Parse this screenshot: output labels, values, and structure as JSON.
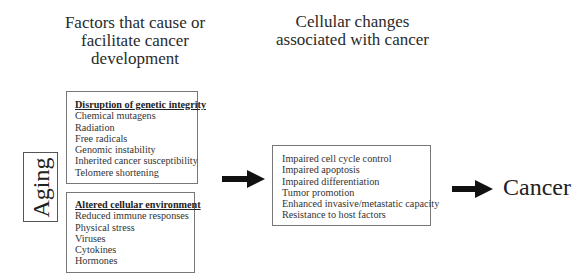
{
  "headings": {
    "left": [
      "Factors that cause or",
      "facilitate cancer",
      "development"
    ],
    "right": [
      "Cellular changes",
      "associated with cancer"
    ]
  },
  "aging_label": "Aging",
  "boxes": {
    "genetic": {
      "title": "Disruption of genetic integrity",
      "items": [
        "Chemical mutagens",
        "Radiation",
        "Free radicals",
        "Genomic instability",
        "Inherited cancer susceptibility",
        "Telomere shortening"
      ]
    },
    "environment": {
      "title": "Altered cellular environment",
      "items": [
        "Reduced immune responses",
        "Physical stress",
        "Viruses",
        "Cytokines",
        "Hormones"
      ]
    },
    "cellular_changes": {
      "items": [
        "Impaired cell cycle control",
        "Impaired apoptosis",
        "Impaired differentiation",
        "Tumor promotion",
        "Enhanced invasive/metastatic capacity",
        "Resistance to host factors"
      ]
    }
  },
  "outcome": "Cancer"
}
